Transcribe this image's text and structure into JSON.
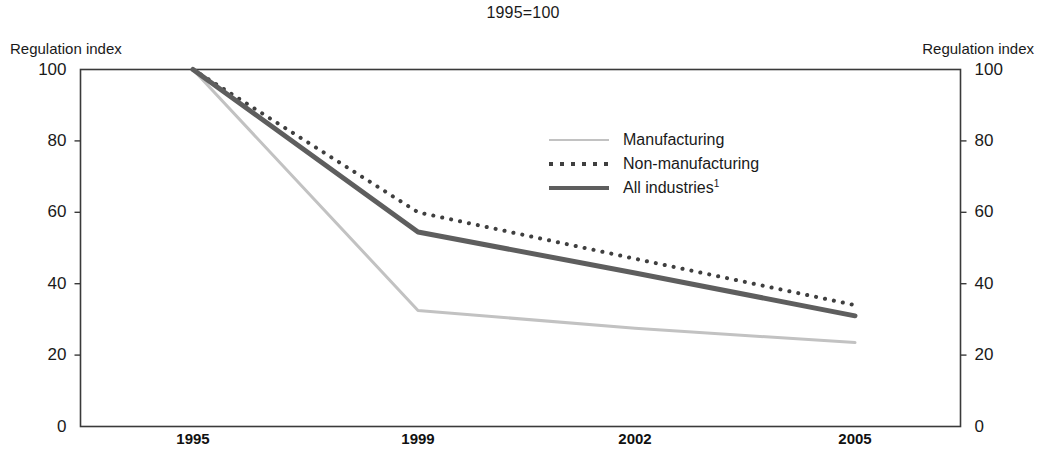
{
  "chart_data": {
    "type": "line",
    "title": "1995=100",
    "xlabel": "",
    "ylabel": "Regulation index",
    "ylabel_right": "Regulation index",
    "x": [
      "1995",
      "1999",
      "2002",
      "2005"
    ],
    "categories": [
      "1995",
      "1999",
      "2002",
      "2005"
    ],
    "xtick_labels": [
      "1995",
      "1999",
      "2002",
      "2005"
    ],
    "ytick_labels": [
      "0",
      "20",
      "40",
      "60",
      "80",
      "100"
    ],
    "ytick_values": [
      0,
      20,
      40,
      60,
      80,
      100
    ],
    "ylim": [
      0,
      100
    ],
    "grid": false,
    "legend_position": "inside-upper-center",
    "series": [
      {
        "name": "Manufacturing",
        "style": "solid",
        "color": "#c2c2c2",
        "width": 3,
        "values": [
          100,
          32.5,
          27.5,
          23.5
        ]
      },
      {
        "name": "Non-manufacturing",
        "style": "dotted",
        "color": "#3f3f3f",
        "width": 4,
        "values": [
          100,
          60,
          47,
          34
        ]
      },
      {
        "name": "All industries¹",
        "style": "solid",
        "color": "#5e5e5e",
        "width": 5,
        "values": [
          100,
          54.5,
          43,
          31
        ]
      }
    ]
  },
  "axis": {
    "left_caption": "Regulation index",
    "right_caption": "Regulation index"
  },
  "legend": {
    "items": [
      {
        "label": "Manufacturing",
        "label_sup": ""
      },
      {
        "label": "Non-manufacturing",
        "label_sup": ""
      },
      {
        "label": "All industries",
        "label_sup": "1"
      }
    ]
  }
}
